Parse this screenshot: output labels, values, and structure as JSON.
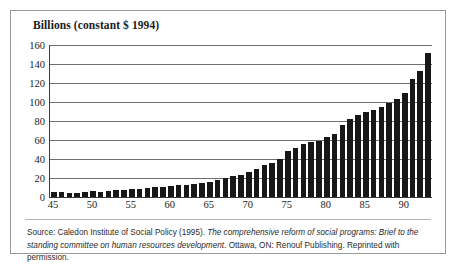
{
  "chart_data": {
    "type": "bar",
    "title": "Billions (constant $ 1994)",
    "xlabel": "",
    "ylabel": "Billions (constant $ 1994)",
    "ylim": [
      0,
      160
    ],
    "ytick_step": 20,
    "yticks": [
      0,
      20,
      40,
      60,
      80,
      100,
      120,
      140,
      160
    ],
    "xticks": [
      45,
      50,
      55,
      60,
      65,
      70,
      75,
      80,
      85,
      90
    ],
    "xtick_labels": [
      "45",
      "50",
      "55",
      "60",
      "65",
      "70",
      "75",
      "80",
      "85",
      "90"
    ],
    "grid": true,
    "legend": null,
    "categories": [
      "45",
      "46",
      "47",
      "48",
      "49",
      "50",
      "51",
      "52",
      "53",
      "54",
      "55",
      "56",
      "57",
      "58",
      "59",
      "60",
      "61",
      "62",
      "63",
      "64",
      "65",
      "66",
      "67",
      "68",
      "69",
      "70",
      "71",
      "72",
      "73",
      "74",
      "75",
      "76",
      "77",
      "78",
      "79",
      "80",
      "81",
      "82",
      "83",
      "84",
      "85",
      "86",
      "87",
      "88",
      "89",
      "90",
      "91",
      "92",
      "93"
    ],
    "values": [
      5,
      5,
      4,
      4,
      5,
      6,
      5,
      6,
      7,
      7,
      8,
      8,
      9,
      11,
      11,
      12,
      13,
      13,
      14,
      15,
      16,
      18,
      20,
      22,
      23,
      26,
      30,
      34,
      36,
      40,
      48,
      52,
      56,
      58,
      59,
      63,
      66,
      76,
      82,
      86,
      90,
      92,
      95,
      99,
      103,
      110,
      124,
      133,
      152
    ]
  },
  "source": {
    "prefix": "Source: Caledon Institute of Social Policy (1995). ",
    "italic_title": "The comprehensive reform of social programs: Brief to the standing committee on human resources development",
    "suffix": ". Ottawa, ON: Renouf Publishing. Reprinted with permission."
  }
}
